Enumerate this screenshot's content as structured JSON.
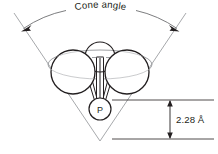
{
  "figure": {
    "kind": "tolman-cone-angle-diagram",
    "background_color": "#ffffff",
    "ink_color": "#231f20",
    "cone_line_color": "#a7a9ac",
    "width": 218,
    "height": 154
  },
  "labels": {
    "cone_angle": "Cone angle",
    "bond_distance": "2.28 Å",
    "central_atom": "P"
  },
  "geometry": {
    "cone": {
      "apex_x": 100,
      "apex_y": 141,
      "left_top_x": 14,
      "left_top_y": 13,
      "right_top_x": 186,
      "right_top_y": 13,
      "arc_radius": 118
    },
    "spheres": [
      {
        "name": "substituent-top",
        "cx": 100,
        "cy": 57,
        "r": 15
      },
      {
        "name": "substituent-left",
        "cx": 73,
        "cy": 72,
        "r": 22
      },
      {
        "name": "substituent-right",
        "cx": 127,
        "cy": 72,
        "r": 22
      }
    ],
    "phosphorus": {
      "cx": 100,
      "cy": 109,
      "r": 11
    },
    "dimension": {
      "top_y": 100,
      "bottom_y": 139,
      "arrow_x": 170,
      "line_left_x": 112,
      "line_right_x": 214,
      "text_x": 176,
      "text_y": 123
    }
  }
}
